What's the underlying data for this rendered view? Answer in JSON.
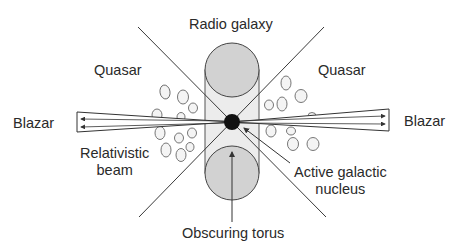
{
  "diagram": {
    "labels": {
      "radio_galaxy": "Radio galaxy",
      "quasar_left": "Quasar",
      "quasar_right": "Quasar",
      "blazar_left": "Blazar",
      "blazar_right": "Blazar",
      "relativistic_beam_line1": "Relativistic",
      "relativistic_beam_line2": "beam",
      "agn_line1": "Active galactic",
      "agn_line2": "nucleus",
      "obscuring_torus": "Obscuring torus"
    },
    "colors": {
      "line": "#3a3a3a",
      "torus_fill": "#d2d2d2",
      "rect_fill": "#ececec",
      "nucleus": "#111111",
      "cloud_stroke": "#555555",
      "background": "#ffffff"
    },
    "nodes": [
      {
        "id": "nucleus",
        "label": "Active galactic nucleus"
      },
      {
        "id": "torus",
        "label": "Obscuring torus"
      },
      {
        "id": "jet",
        "label": "Relativistic beam"
      },
      {
        "id": "clouds",
        "label": "Broad-line clouds"
      }
    ],
    "viewing_angles": [
      "Radio galaxy",
      "Quasar",
      "Blazar"
    ]
  }
}
